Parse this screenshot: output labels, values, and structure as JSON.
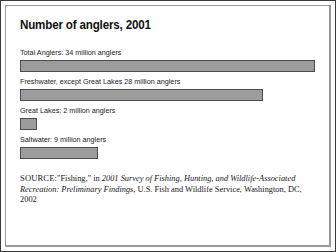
{
  "figure": {
    "title": "Number of anglers, 2001",
    "source": {
      "lead": "SOURCE:",
      "pre_title": "\"Fishing,\" in ",
      "italic_title": "2001 Survey of Fishing, Hunting, and Wildlife-Associated Recreation: Preliminary Findings",
      "post_title": ", U.S. Fish and Wildlife Service, Washington, DC, 2002"
    },
    "colors": {
      "bar_fill": "#9c9c9c",
      "bar_border": "#4c4c4c",
      "outer_border": "#3a3a3a",
      "inner_border": "#9a9a9a",
      "background": "#ffffff",
      "text": "#111111"
    }
  },
  "chart_data": {
    "type": "bar",
    "orientation": "horizontal",
    "title": "Number of anglers, 2001",
    "xlabel": "",
    "ylabel": "",
    "unit": "million anglers",
    "xlim": [
      0,
      34
    ],
    "grid": false,
    "legend": null,
    "categories": [
      "Total Anglers",
      "Freshwater, except Great Lakes",
      "Great Lakes",
      "Saltwater"
    ],
    "values": [
      34,
      28,
      2,
      9
    ],
    "labels": [
      "Total Anglers: 34 million anglers",
      "Freshwater, except Great Lakes 28 million anglers",
      "Great Lakes: 2 million anglers",
      "Saltwater: 9 million anglers"
    ],
    "bar_percent_of_max": [
      100,
      82.4,
      5.9,
      26.5
    ]
  }
}
